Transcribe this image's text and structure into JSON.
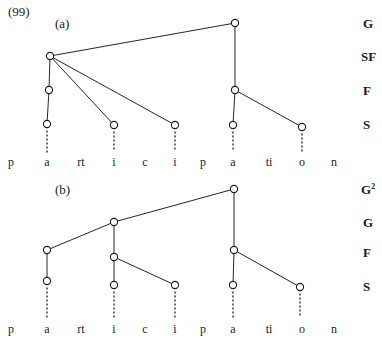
{
  "figure": {
    "example_number": "(99)",
    "background_color": "#ffffff",
    "line_color": "#262626",
    "node_fill": "#ffffff",
    "node_stroke": "#1a1a1a"
  },
  "diagrams": [
    {
      "sub_label": "(a)",
      "sub_label_x": 55,
      "sub_label_y": 16,
      "tier_labels": [
        {
          "text": "G",
          "sup": "",
          "x": 363,
          "y": 24
        },
        {
          "text": "SF",
          "sup": "",
          "x": 361,
          "y": 57
        },
        {
          "text": "F",
          "sup": "",
          "x": 363,
          "y": 91
        },
        {
          "text": "S",
          "sup": "",
          "x": 363,
          "y": 125
        }
      ],
      "nodes": [
        {
          "id": "a-G",
          "tier": "G",
          "x": 235,
          "y": 23
        },
        {
          "id": "a-SF",
          "tier": "SF",
          "x": 50,
          "y": 56
        },
        {
          "id": "a-F1",
          "tier": "F",
          "x": 49,
          "y": 90
        },
        {
          "id": "a-F2",
          "tier": "F",
          "x": 235,
          "y": 90
        },
        {
          "id": "a-S1",
          "tier": "S",
          "x": 47,
          "y": 124
        },
        {
          "id": "a-S2",
          "tier": "S",
          "x": 114,
          "y": 125
        },
        {
          "id": "a-S3",
          "tier": "S",
          "x": 175,
          "y": 125
        },
        {
          "id": "a-S4",
          "tier": "S",
          "x": 233,
          "y": 125
        },
        {
          "id": "a-S5",
          "tier": "S",
          "x": 302,
          "y": 127
        }
      ],
      "edges": [
        {
          "from": "a-G",
          "to": "a-SF"
        },
        {
          "from": "a-G",
          "to": "a-F2"
        },
        {
          "from": "a-SF",
          "to": "a-F1"
        },
        {
          "from": "a-SF",
          "to": "a-S2"
        },
        {
          "from": "a-SF",
          "to": "a-S3"
        },
        {
          "from": "a-F1",
          "to": "a-S1"
        },
        {
          "from": "a-F2",
          "to": "a-S4"
        },
        {
          "from": "a-F2",
          "to": "a-S5"
        }
      ],
      "association_lines": [
        {
          "x": 47,
          "y1": 131,
          "y2": 152
        },
        {
          "x": 114,
          "y1": 132,
          "y2": 152
        },
        {
          "x": 175,
          "y1": 132,
          "y2": 152
        },
        {
          "x": 233,
          "y1": 132,
          "y2": 152
        },
        {
          "x": 302,
          "y1": 134,
          "y2": 152
        }
      ],
      "segments": [
        {
          "text": "p",
          "x": 11,
          "y": 155
        },
        {
          "text": "a",
          "x": 47,
          "y": 155
        },
        {
          "text": "rt",
          "x": 81,
          "y": 155
        },
        {
          "text": "i",
          "x": 114,
          "y": 155
        },
        {
          "text": "c",
          "x": 145,
          "y": 155
        },
        {
          "text": "i",
          "x": 175,
          "y": 155
        },
        {
          "text": "p",
          "x": 203,
          "y": 155
        },
        {
          "text": "a",
          "x": 233,
          "y": 155
        },
        {
          "text": "ti",
          "x": 269,
          "y": 155
        },
        {
          "text": "o",
          "x": 302,
          "y": 155
        },
        {
          "text": "n",
          "x": 334,
          "y": 155
        }
      ]
    },
    {
      "sub_label": "(b)",
      "sub_label_x": 55,
      "sub_label_y": 182,
      "tier_labels": [
        {
          "text": "G",
          "sup": "2",
          "x": 361,
          "y": 190
        },
        {
          "text": "G",
          "sup": "",
          "x": 363,
          "y": 223
        },
        {
          "text": "F",
          "sup": "",
          "x": 363,
          "y": 253
        },
        {
          "text": "S",
          "sup": "",
          "x": 363,
          "y": 287
        }
      ],
      "nodes": [
        {
          "id": "b-G2",
          "tier": "G2",
          "x": 234,
          "y": 189
        },
        {
          "id": "b-G",
          "tier": "G",
          "x": 114,
          "y": 222
        },
        {
          "id": "b-F1",
          "tier": "F",
          "x": 47,
          "y": 250
        },
        {
          "id": "b-F2",
          "tier": "F",
          "x": 114,
          "y": 257
        },
        {
          "id": "b-F3",
          "tier": "F",
          "x": 234,
          "y": 250
        },
        {
          "id": "b-S1",
          "tier": "S",
          "x": 47,
          "y": 281
        },
        {
          "id": "b-S2",
          "tier": "S",
          "x": 114,
          "y": 285
        },
        {
          "id": "b-S3",
          "tier": "S",
          "x": 175,
          "y": 285
        },
        {
          "id": "b-S4",
          "tier": "S",
          "x": 233,
          "y": 285
        },
        {
          "id": "b-S5",
          "tier": "S",
          "x": 300,
          "y": 287
        }
      ],
      "edges": [
        {
          "from": "b-G2",
          "to": "b-G"
        },
        {
          "from": "b-G2",
          "to": "b-F3"
        },
        {
          "from": "b-G",
          "to": "b-F1"
        },
        {
          "from": "b-G",
          "to": "b-F2"
        },
        {
          "from": "b-F1",
          "to": "b-S1"
        },
        {
          "from": "b-F2",
          "to": "b-S2"
        },
        {
          "from": "b-F2",
          "to": "b-S3"
        },
        {
          "from": "b-F3",
          "to": "b-S4"
        },
        {
          "from": "b-F3",
          "to": "b-S5"
        }
      ],
      "association_lines": [
        {
          "x": 47,
          "y1": 288,
          "y2": 318
        },
        {
          "x": 114,
          "y1": 292,
          "y2": 318
        },
        {
          "x": 175,
          "y1": 292,
          "y2": 318
        },
        {
          "x": 233,
          "y1": 292,
          "y2": 318
        },
        {
          "x": 300,
          "y1": 294,
          "y2": 318
        }
      ],
      "segments": [
        {
          "text": "p",
          "x": 11,
          "y": 322
        },
        {
          "text": "a",
          "x": 47,
          "y": 322
        },
        {
          "text": "rt",
          "x": 81,
          "y": 322
        },
        {
          "text": "i",
          "x": 114,
          "y": 322
        },
        {
          "text": "c",
          "x": 145,
          "y": 322
        },
        {
          "text": "i",
          "x": 175,
          "y": 322
        },
        {
          "text": "p",
          "x": 203,
          "y": 322
        },
        {
          "text": "a",
          "x": 233,
          "y": 322
        },
        {
          "text": "ti",
          "x": 269,
          "y": 322
        },
        {
          "text": "o",
          "x": 302,
          "y": 322
        },
        {
          "text": "n",
          "x": 334,
          "y": 322
        }
      ]
    }
  ]
}
